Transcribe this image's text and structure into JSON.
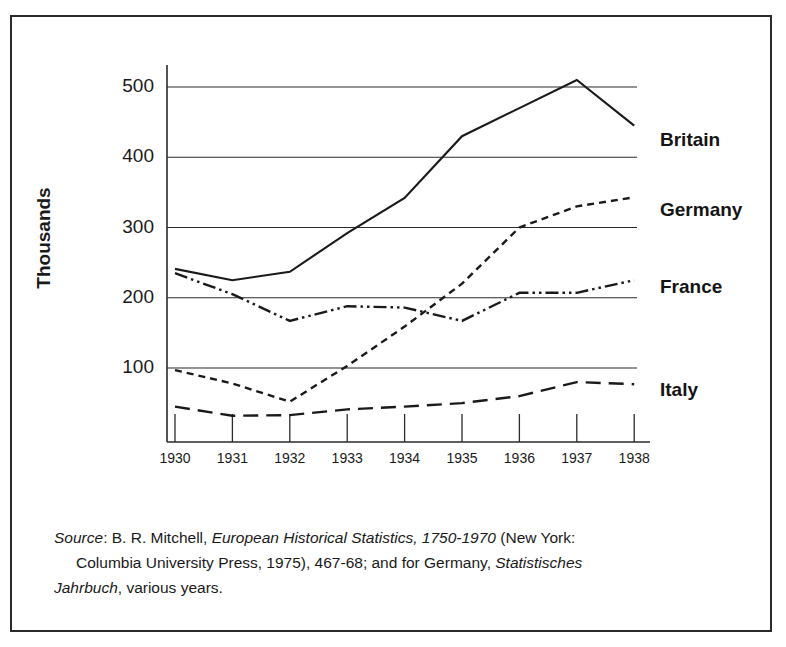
{
  "figure": {
    "y_axis_title": "Thousands",
    "source_note": {
      "label": "Source",
      "line1_rest": ": B. R. Mitchell, ",
      "work_title": "European Historical Statistics, 1750-1970",
      "line1_tail": " (New York:",
      "line2": "Columbia University Press, 1975), 467-68; and for Germany, ",
      "work_title2": "Statistisches",
      "line3_title": "Jahrbuch",
      "line3_rest": ", various years."
    }
  },
  "chart_data": {
    "type": "line",
    "title": "",
    "xlabel": "",
    "ylabel": "Thousands",
    "categories": [
      "1930",
      "1931",
      "1932",
      "1933",
      "1934",
      "1935",
      "1936",
      "1937",
      "1938"
    ],
    "x": [
      1930,
      1931,
      1932,
      1933,
      1934,
      1935,
      1936,
      1937,
      1938
    ],
    "ylim": [
      0,
      540
    ],
    "xlim": [
      1930,
      1938
    ],
    "yticks": [
      100,
      200,
      300,
      400,
      500
    ],
    "ytick_labels": [
      "100",
      "200",
      "300",
      "400",
      "500"
    ],
    "grid": true,
    "grid_axis": "y",
    "legend_position": "right-inline-labels",
    "series": [
      {
        "name": "Britain",
        "style": "solid",
        "color": "#1a1a1a",
        "values": [
          241,
          225,
          237,
          292,
          342,
          430,
          470,
          510,
          445
        ],
        "label_y": 112
      },
      {
        "name": "Germany",
        "style": "dashed-fine",
        "color": "#1a1a1a",
        "values": [
          97,
          78,
          52,
          103,
          159,
          220,
          300,
          330,
          343
        ],
        "label_y": 182
      },
      {
        "name": "France",
        "style": "dash-dot-dot",
        "color": "#1a1a1a",
        "values": [
          235,
          205,
          167,
          188,
          186,
          167,
          207,
          207,
          225
        ],
        "label_y": 259
      },
      {
        "name": "Italy",
        "style": "dashed-long",
        "color": "#1a1a1a",
        "values": [
          45,
          32,
          33,
          41,
          45,
          50,
          60,
          80,
          77
        ],
        "label_y": 362
      }
    ]
  }
}
